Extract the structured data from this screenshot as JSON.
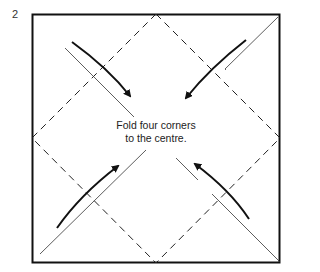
{
  "step_number": "2",
  "caption": {
    "line1": "Fold four corners",
    "line2": "to the centre."
  },
  "diagram": {
    "square": {
      "x1": 32,
      "y1": 14,
      "x2": 280,
      "y2": 263
    },
    "fold_lines": "dashed diamond joining edge midpoints",
    "arrows": [
      "top-left to centre",
      "top-right to centre",
      "bottom-left to centre",
      "bottom-right to centre"
    ],
    "line_color": "#111111"
  }
}
